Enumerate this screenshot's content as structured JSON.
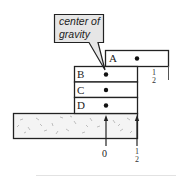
{
  "callout": {
    "line1": "center of",
    "line2": "gravity"
  },
  "blocks": [
    {
      "label": "A"
    },
    {
      "label": "B"
    },
    {
      "label": "C"
    },
    {
      "label": "D"
    }
  ],
  "overhang_labels": {
    "top_right": {
      "num": "1",
      "den": "2"
    },
    "bottom_zero": "0",
    "bottom_right": {
      "num": "1",
      "den": "2"
    }
  },
  "colors": {
    "stroke": "#222222",
    "callout_fill": "#e6e6e6",
    "ground_fill": "#f4f4f4"
  }
}
